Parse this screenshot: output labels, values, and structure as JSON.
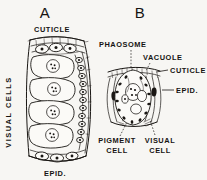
{
  "figure": {
    "kind": "scientific-line-drawing",
    "background_color": "#f7f6f3",
    "ink_color": "#1a1714"
  },
  "panels": [
    {
      "id": "A",
      "title": "A",
      "view": "longitudinal section through a column of visual cells",
      "labels": [
        {
          "text": "CUTICLE",
          "name": "label-cuticle-a",
          "position": "top"
        },
        {
          "text": "VISUAL CELLS",
          "name": "label-visual-cells-a",
          "position": "left-rotated"
        },
        {
          "text": "EPID.",
          "name": "label-epid-a",
          "position": "bottom"
        }
      ]
    },
    {
      "id": "B",
      "title": "B",
      "view": "cross section through a single visual cell with phaosome",
      "labels": [
        {
          "text": "PHAOSOME",
          "name": "label-phaosome-b",
          "position": "top-left"
        },
        {
          "text": "VACUOLE",
          "name": "label-vacuole-b",
          "position": "top-right"
        },
        {
          "text": "CUTICLE",
          "name": "label-cuticle-b",
          "position": "right-upper"
        },
        {
          "text": "EPID.",
          "name": "label-epid-b",
          "position": "right-middle"
        },
        {
          "text": "PIGMENT",
          "name": "label-pigment-b",
          "position": "bottom-left"
        },
        {
          "text": "CELL",
          "name": "label-pigment-cell-b",
          "position": "bottom-left"
        },
        {
          "text": "VISUAL",
          "name": "label-visual-b",
          "position": "bottom-right"
        },
        {
          "text": "CELL",
          "name": "label-visual-cell-b",
          "position": "bottom-right"
        }
      ]
    }
  ]
}
